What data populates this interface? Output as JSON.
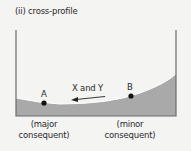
{
  "title": "(ii) cross-profile",
  "points": {
    "a": {
      "label": "A",
      "caption_line1": "(major",
      "caption_line2": "consequent)"
    },
    "b": {
      "label": "B",
      "caption_line1": "(minor",
      "caption_line2": "consequent)"
    }
  },
  "arrow_label": "X and Y",
  "colors": {
    "background": "#f4f4f3",
    "fill": "#a9a9a9",
    "outline": "#6b6b6b",
    "point": "#111111"
  }
}
